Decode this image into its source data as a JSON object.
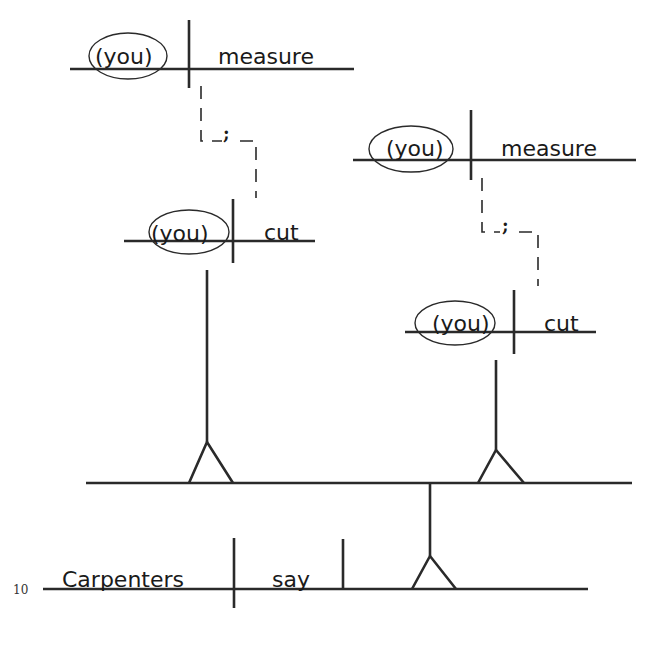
{
  "diagram": {
    "type": "sentence-diagram",
    "line_number": "10",
    "main_clause": {
      "subject": "Carpenters",
      "verb": "say"
    },
    "direct_object_compound": {
      "left_branch": {
        "clause_1": {
          "subject": "(you)",
          "verb": "measure"
        },
        "conjunction": ";",
        "clause_2": {
          "subject": "(you)",
          "verb": "cut"
        }
      },
      "right_branch": {
        "clause_1": {
          "subject": "(you)",
          "verb": "measure"
        },
        "conjunction": ";",
        "clause_2": {
          "subject": "(you)",
          "verb": "cut"
        }
      }
    },
    "colors": {
      "ink": "#2a2a2a",
      "background": "#ffffff"
    }
  }
}
